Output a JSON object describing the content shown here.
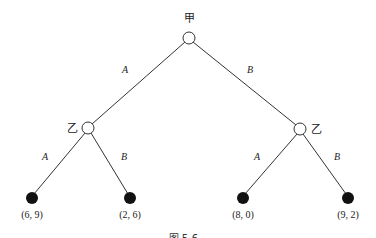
{
  "tree": {
    "root": {
      "label": "甲",
      "x": 189,
      "y": 38
    },
    "players": [
      {
        "id": "left",
        "label": "乙",
        "x": 88,
        "y": 128,
        "label_x": 72,
        "label_y": 132
      },
      {
        "id": "right",
        "label": "乙",
        "x": 300,
        "y": 129,
        "label_x": 308,
        "label_y": 133
      }
    ],
    "edges_top": [
      {
        "label": "A",
        "lx": 125,
        "ly": 70
      },
      {
        "label": "B",
        "lx": 250,
        "ly": 70
      }
    ],
    "edges_bottom": [
      {
        "label": "A",
        "lx": 45,
        "ly": 160
      },
      {
        "label": "B",
        "lx": 124,
        "ly": 160
      },
      {
        "label": "A",
        "lx": 257,
        "ly": 160
      },
      {
        "label": "B",
        "lx": 337,
        "ly": 160
      }
    ],
    "leaves": [
      {
        "payoff": "(6, 9)",
        "x": 32,
        "y": 198
      },
      {
        "payoff": "(2, 6)",
        "x": 130,
        "y": 198
      },
      {
        "payoff": "(8, 0)",
        "x": 243,
        "y": 198
      },
      {
        "payoff": "(9, 2)",
        "x": 348,
        "y": 198
      }
    ]
  },
  "caption": "图 5-6 …"
}
